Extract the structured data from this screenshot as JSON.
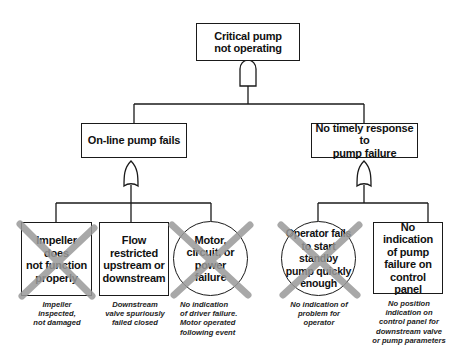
{
  "diagram": {
    "type": "fault-tree",
    "top_event": {
      "label": "Critical pump\nnot operating",
      "gate": "AND"
    },
    "intermediate": [
      {
        "label": "On-line pump fails",
        "gate": "OR"
      },
      {
        "label": "No timely response to\npump failure",
        "gate": "OR"
      }
    ],
    "basic_events": [
      {
        "label": "Impeller does\nnot function\nproperly",
        "shape": "box",
        "crossed_out": true,
        "note": "Impeller\ninspected,\nnot damaged"
      },
      {
        "label": "Flow\nrestricted\nupstream or\ndownstream",
        "shape": "box",
        "crossed_out": false,
        "note": "Downstream\nvalve spuriously\nfailed closed"
      },
      {
        "label": "Motor,\ncircuit, or\npower\nfailure",
        "shape": "circle",
        "crossed_out": true,
        "note": "No indication\nof driver failure.\nMotor operated\nfollowing event"
      },
      {
        "label": "Operator fails\nto start standby\npump quickly\nenough",
        "shape": "circle",
        "crossed_out": true,
        "note": "No indication of\nproblem for\noperator"
      },
      {
        "label": "No indication\nof pump\nfailure on\ncontrol panel",
        "shape": "box",
        "crossed_out": false,
        "note": "No position\nindication on\ncontrol panel for\ndownstream valve\nor pump parameters"
      }
    ],
    "colors": {
      "line": "#1a1a1a",
      "cross": "#9a9a9a",
      "background": "#ffffff"
    }
  }
}
